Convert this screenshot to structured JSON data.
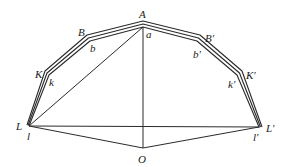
{
  "diagram": {
    "type": "geometric-construction",
    "colors": {
      "line": "#2a2a2a",
      "label": "#1a1a1a",
      "background": "#ffffff"
    },
    "points": {
      "A": {
        "label": "A",
        "x": 143,
        "y": 22
      },
      "B": {
        "label": "B",
        "x": 87,
        "y": 36
      },
      "K": {
        "label": "K",
        "x": 45,
        "y": 72
      },
      "L": {
        "label": "L",
        "x": 27,
        "y": 125
      },
      "Bp": {
        "label": "B′",
        "x": 200,
        "y": 36
      },
      "Kp": {
        "label": "K′",
        "x": 242,
        "y": 72
      },
      "Lp": {
        "label": "L′",
        "x": 262,
        "y": 127
      },
      "a": {
        "label": "a",
        "x": 143,
        "y": 27
      },
      "b": {
        "label": "b",
        "x": 90,
        "y": 42
      },
      "k": {
        "label": "k",
        "x": 50,
        "y": 76
      },
      "l": {
        "label": "l",
        "x": 29,
        "y": 126
      },
      "bp": {
        "label": "b′",
        "x": 197,
        "y": 42
      },
      "kp": {
        "label": "k′",
        "x": 237,
        "y": 76
      },
      "lp": {
        "label": "l′",
        "x": 259,
        "y": 127
      },
      "O": {
        "label": "O",
        "x": 143,
        "y": 148
      }
    },
    "labels": {
      "A": "A",
      "B": "B",
      "K": "K",
      "L": "L",
      "Bp": "B′",
      "Kp": "K′",
      "Lp": "L′",
      "a": "a",
      "b": "b",
      "k": "k",
      "l": "l",
      "bp": "b′",
      "kp": "k′",
      "lp": "l′",
      "O": "O"
    },
    "segments": [
      "outer polygon L-K-B-A-B′-K′-L′",
      "middle polygon",
      "inner polygon l-k-b-a-b′-k′-l′",
      "A-O",
      "L-L′",
      "l-a",
      "l-O",
      "O-l′"
    ]
  }
}
